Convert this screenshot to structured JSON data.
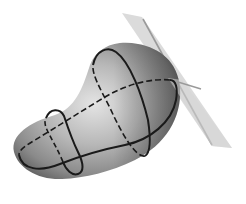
{
  "figure": {
    "colors": {
      "background": "#ffffff",
      "surface_light": "#e2e2e2",
      "surface_mid": "#a8a8a8",
      "surface_dark": "#5a5a5a",
      "curve": "#1a1a1a",
      "plane": "#cfcfcf",
      "plane_line": "#9a9a9a"
    },
    "elements": [
      {
        "name": "surface",
        "kind": "blob"
      },
      {
        "name": "large-loop",
        "kind": "closed-curve"
      },
      {
        "name": "small-loop",
        "kind": "closed-curve"
      },
      {
        "name": "long-curve",
        "kind": "closed-curve"
      },
      {
        "name": "tangent-plane",
        "kind": "plane"
      },
      {
        "name": "plane-line",
        "kind": "line"
      }
    ]
  }
}
